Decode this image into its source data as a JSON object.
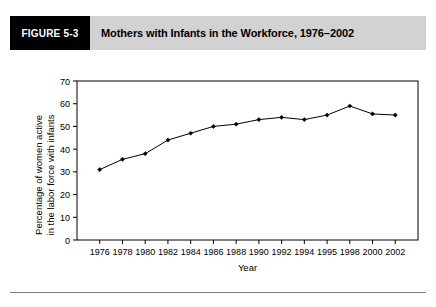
{
  "figure": {
    "number_label": "FIGURE 5-3",
    "title": "Mothers with Infants in the Workforce, 1976–2002"
  },
  "colors": {
    "header_block": "#000000",
    "header_band": "#d2d2d2",
    "line": "#000000",
    "marker": "#000000",
    "frame": "#000000",
    "rule": "#808080"
  },
  "chart_data": {
    "type": "line",
    "title": "Mothers with Infants in the Workforce, 1976–2002",
    "xlabel": "Year",
    "ylabel": "Percentage of women active in the labor force with infants",
    "ylabel_line1": "Percentage of women active",
    "ylabel_line2": "in the labor force with infants",
    "categories": [
      "1976",
      "1978",
      "1980",
      "1982",
      "1984",
      "1986",
      "1988",
      "1990",
      "1992",
      "1994",
      "1995",
      "1998",
      "2000",
      "2002"
    ],
    "values": [
      31,
      35.5,
      38,
      44,
      47,
      50,
      51,
      53,
      54,
      53,
      55,
      59,
      55.5,
      55
    ],
    "ylim": [
      0,
      70
    ],
    "ytick_values": [
      0,
      10,
      20,
      30,
      40,
      50,
      60,
      70
    ],
    "ytick_labels": [
      "0",
      "10",
      "20",
      "30",
      "40",
      "50",
      "60",
      "70"
    ],
    "grid": false,
    "legend": null,
    "marker": "diamond",
    "series": [
      {
        "name": "Percentage of women active in the labor force with infants",
        "values": [
          31,
          35.5,
          38,
          44,
          47,
          50,
          51,
          53,
          54,
          53,
          55,
          59,
          55.5,
          55
        ]
      }
    ]
  }
}
